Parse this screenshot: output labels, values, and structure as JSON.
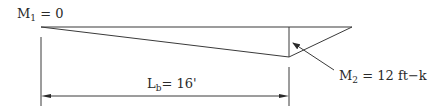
{
  "diagram": {
    "type": "moment-diagram",
    "labels": {
      "m1": {
        "main": "M",
        "sub": "1",
        "rest": " = 0"
      },
      "m2": {
        "main": "M",
        "sub": "2",
        "rest": " = 12 ft−k"
      },
      "lb": {
        "main": "L",
        "sub": "b",
        "rest": "= 16'"
      }
    },
    "values": {
      "M1": 0,
      "M2": 12,
      "moment_unit": "ft-k",
      "Lb": 16,
      "length_unit": "ft"
    },
    "colors": {
      "line": "#3a3a3a",
      "text": "#2a2a2a",
      "background": "#ffffff"
    }
  }
}
